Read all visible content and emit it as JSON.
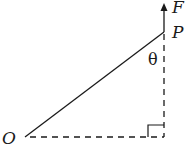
{
  "diagram": {
    "labels": {
      "origin": "O",
      "point": "P",
      "force": "F",
      "angle": "θ"
    },
    "colors": {
      "stroke": "#1a1a1a",
      "background": "#ffffff"
    },
    "elements": {
      "segment_OP": {
        "from": "O",
        "to": "P",
        "style": "solid"
      },
      "force_arrow": {
        "at": "P",
        "direction": "up",
        "label": "F"
      },
      "vertical_projection": {
        "from": "P",
        "style": "dashed"
      },
      "horizontal_projection": {
        "from": "O",
        "style": "dashed"
      },
      "right_angle_marker": true
    }
  }
}
